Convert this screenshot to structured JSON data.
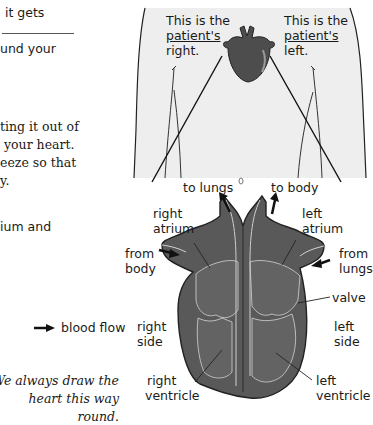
{
  "body_text": {
    "line1": "it gets",
    "line2": "und your",
    "para_lines": [
      "ting it out of",
      "your heart.",
      "eeze so that",
      "y."
    ],
    "line_atrium": "ium and"
  },
  "torso_labels": {
    "right": {
      "line1": "This is the",
      "line2": "patient's",
      "line3": "right."
    },
    "left": {
      "line1": "This is the",
      "line2": "patient's",
      "line3": "left."
    }
  },
  "heart_labels": {
    "to_lungs": "to lungs",
    "to_body": "to body",
    "right_atrium": [
      "right",
      "atrium"
    ],
    "left_atrium": [
      "left",
      "atrium"
    ],
    "from_body": [
      "from",
      "body"
    ],
    "from_lungs": [
      "from",
      "lungs"
    ],
    "valve": "valve",
    "right_side": [
      "right",
      "side"
    ],
    "left_side": [
      "left",
      "side"
    ],
    "right_ventricle": [
      "right",
      "ventricle"
    ],
    "left_ventricle": [
      "left",
      "ventricle"
    ]
  },
  "legend": {
    "icon": "arrow-right-icon",
    "label": "blood flow"
  },
  "caption": [
    "We always draw the",
    "heart this way round."
  ],
  "colors": {
    "torso_fill": "#eeeeee",
    "heart_fill": "#5a5a5a",
    "heart_dark": "#3e3e3e",
    "heart_line": "#c8c8c8",
    "text": "#1a1a1a"
  }
}
